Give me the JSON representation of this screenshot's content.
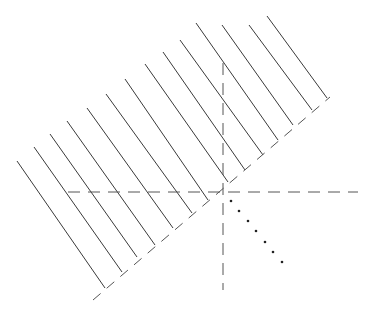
{
  "diagram": {
    "colors": {
      "background": "#ffffff",
      "stroke": "#3a3a3a",
      "dash": "#555555",
      "dot": "#222222"
    },
    "parallel_lines": [
      {
        "x1": 17,
        "y1": 161,
        "x2": 105,
        "y2": 288
      },
      {
        "x1": 34,
        "y1": 147,
        "x2": 122,
        "y2": 272
      },
      {
        "x1": 50,
        "y1": 134,
        "x2": 137,
        "y2": 257
      },
      {
        "x1": 67,
        "y1": 121,
        "x2": 155,
        "y2": 245
      },
      {
        "x1": 87,
        "y1": 108,
        "x2": 173,
        "y2": 228
      },
      {
        "x1": 106,
        "y1": 94,
        "x2": 192,
        "y2": 213
      },
      {
        "x1": 125,
        "y1": 79,
        "x2": 208,
        "y2": 200
      },
      {
        "x1": 145,
        "y1": 64,
        "x2": 228,
        "y2": 182
      },
      {
        "x1": 163,
        "y1": 52,
        "x2": 245,
        "y2": 170
      },
      {
        "x1": 180,
        "y1": 40,
        "x2": 263,
        "y2": 155
      },
      {
        "x1": 196,
        "y1": 23,
        "x2": 278,
        "y2": 140
      },
      {
        "x1": 222,
        "y1": 25,
        "x2": 293,
        "y2": 125
      },
      {
        "x1": 249,
        "y1": 25,
        "x2": 312,
        "y2": 110
      },
      {
        "x1": 267,
        "y1": 16,
        "x2": 327,
        "y2": 98
      }
    ],
    "dashed_baseline": {
      "x1": 93,
      "y1": 300,
      "x2": 330,
      "y2": 97
    },
    "dashed_horizontal_axis": {
      "x1": 68,
      "y1": 192,
      "x2": 358,
      "y2": 192
    },
    "dashed_vertical_axis": {
      "x1": 223,
      "y1": 63,
      "x2": 223,
      "y2": 290
    },
    "origin": {
      "x": 223,
      "y": 192
    },
    "dotted_ray_points": [
      {
        "x": 231,
        "y": 201
      },
      {
        "x": 239,
        "y": 211
      },
      {
        "x": 248,
        "y": 221
      },
      {
        "x": 256,
        "y": 231
      },
      {
        "x": 265,
        "y": 242
      },
      {
        "x": 273,
        "y": 252
      },
      {
        "x": 282,
        "y": 262
      }
    ]
  }
}
